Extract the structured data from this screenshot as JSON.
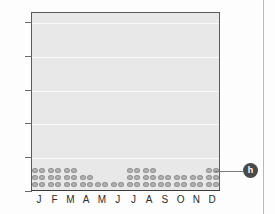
{
  "chart_data": {
    "type": "scatter",
    "plot_style": "dot-plot",
    "title": "",
    "subtitle": "",
    "xlabel": "",
    "ylabel": "",
    "categories": [
      "J",
      "F",
      "M",
      "A",
      "M",
      "J",
      "J",
      "A",
      "S",
      "O",
      "N",
      "D"
    ],
    "category_full_names": [
      "January",
      "February",
      "March",
      "April",
      "May",
      "June",
      "July",
      "August",
      "September",
      "October",
      "November",
      "December"
    ],
    "values": [
      6,
      6,
      6,
      4,
      2,
      2,
      6,
      6,
      4,
      4,
      4,
      6
    ],
    "series": [
      {
        "name": "count",
        "values": [
          6,
          6,
          6,
          4,
          2,
          2,
          6,
          6,
          4,
          4,
          4,
          6
        ]
      }
    ],
    "ylim": [
      0,
      26.5
    ],
    "xlim": [
      0,
      12
    ],
    "ytick_values": [
      0,
      5,
      10,
      15,
      20,
      25
    ],
    "ytick_labels": [
      "0",
      "5",
      "10",
      "15",
      "20",
      "25"
    ],
    "grid": true,
    "grid_axis": "y",
    "legend": false,
    "legend_position": "none",
    "dots_per_row": 2,
    "dot_row_value_step": 1,
    "colors": {
      "plot_background": "#e8e8e8",
      "gridline": "#fbfbfb",
      "dot_fill": "#b3b3b3",
      "dot_stroke": "#8f8f8f",
      "axis": "#5a5a5a",
      "text": "#2b2b2b",
      "callout_badge": "#4a4a4a",
      "callout_badge_text": "#ffffff",
      "divider": "#b9b9b9"
    }
  },
  "callout": {
    "label": "h",
    "target_category": "D"
  }
}
